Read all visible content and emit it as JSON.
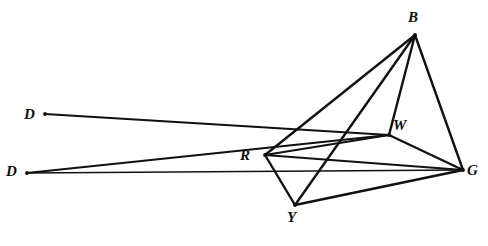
{
  "figure": {
    "kind": "geometric-line-diagram",
    "width": 488,
    "height": 246,
    "background_color": "#ffffff",
    "stroke_color": "#111111",
    "labels": [
      {
        "id": "D1",
        "text": "D",
        "x": 24,
        "y": 107
      },
      {
        "id": "D2",
        "text": "D",
        "x": 6,
        "y": 164
      },
      {
        "id": "R",
        "text": "R",
        "x": 240,
        "y": 148
      },
      {
        "id": "Y",
        "text": "Y",
        "x": 287,
        "y": 210
      },
      {
        "id": "B",
        "text": "B",
        "x": 408,
        "y": 10
      },
      {
        "id": "W",
        "text": "W",
        "x": 393,
        "y": 118
      },
      {
        "id": "G",
        "text": "G",
        "x": 467,
        "y": 163
      }
    ],
    "points": {
      "D1": {
        "x": 45,
        "y": 114
      },
      "D2": {
        "x": 27,
        "y": 173
      },
      "R": {
        "x": 265,
        "y": 155
      },
      "Y": {
        "x": 295,
        "y": 205
      },
      "B": {
        "x": 415,
        "y": 35
      },
      "W": {
        "x": 389,
        "y": 135
      },
      "G": {
        "x": 463,
        "y": 170
      }
    },
    "segments": [
      {
        "name": "segment-D1-W",
        "from": "D1",
        "to": "W",
        "width": 2.2
      },
      {
        "name": "segment-D2-W",
        "from": "D2",
        "to": "W",
        "width": 2.2
      },
      {
        "name": "segment-D2-G",
        "from": "D2",
        "to": "G",
        "width": 1.6
      },
      {
        "name": "segment-B-R",
        "from": "B",
        "to": "R",
        "width": 2.4
      },
      {
        "name": "segment-B-Y",
        "from": "B",
        "to": "Y",
        "width": 2.4
      },
      {
        "name": "segment-B-W",
        "from": "B",
        "to": "W",
        "width": 2.4
      },
      {
        "name": "segment-B-G",
        "from": "B",
        "to": "G",
        "width": 2.4
      },
      {
        "name": "segment-R-W",
        "from": "R",
        "to": "W",
        "width": 2.2
      },
      {
        "name": "segment-R-G",
        "from": "R",
        "to": "G",
        "width": 2.2
      },
      {
        "name": "segment-R-Y",
        "from": "R",
        "to": "Y",
        "width": 2.4
      },
      {
        "name": "segment-W-G",
        "from": "W",
        "to": "G",
        "width": 2.4
      },
      {
        "name": "segment-Y-G",
        "from": "Y",
        "to": "G",
        "width": 2.4
      }
    ]
  }
}
